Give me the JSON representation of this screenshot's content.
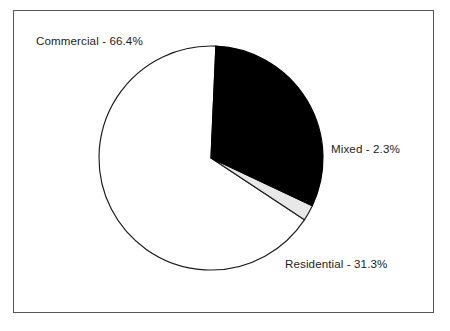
{
  "chart_data": {
    "type": "pie",
    "title": "",
    "subtitle": "",
    "xlabel": "",
    "ylabel": "",
    "legend_position": "none",
    "grid": false,
    "label_format": "{name} - {value}%",
    "categories": [
      "Commercial",
      "Mixed",
      "Residential"
    ],
    "values": [
      66.4,
      2.3,
      31.3
    ],
    "slices": [
      {
        "name": "Commercial",
        "value": 66.4,
        "label": "Commercial - 66.4%",
        "fill": "#ffffff",
        "stroke": "#1a1a1a",
        "start_angle_deg": 87.5,
        "end_angle_deg": 326.5,
        "label_position": "top-left"
      },
      {
        "name": "Mixed",
        "value": 2.3,
        "label": "Mixed - 2.3%",
        "fill": "#e8e8e8",
        "stroke": "#1a1a1a",
        "start_angle_deg": 326.5,
        "end_angle_deg": 334.8,
        "label_position": "right"
      },
      {
        "name": "Residential",
        "value": 31.3,
        "label": "Residential - 31.3%",
        "fill": "#000000",
        "stroke": "#000000",
        "start_angle_deg": 334.8,
        "end_angle_deg": 447.5,
        "label_position": "bottom-right"
      }
    ],
    "total": 100.0,
    "geometry": {
      "center_x": 211,
      "center_y": 158,
      "radius": 112
    },
    "frame": {
      "visible": true,
      "color": "#555555"
    }
  }
}
